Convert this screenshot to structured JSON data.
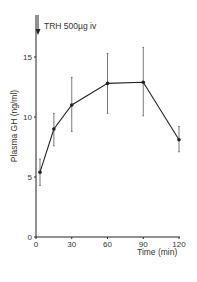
{
  "chart_data": {
    "type": "line",
    "title": "",
    "xlabel": "Time (min)",
    "ylabel": "Plasma GH (ng/ml)",
    "x": [
      0,
      15,
      30,
      60,
      90,
      120
    ],
    "series": [
      {
        "name": "Plasma GH",
        "values": [
          5.4,
          9.0,
          11.0,
          12.8,
          12.9,
          8.1
        ],
        "error_upper": [
          6.5,
          10.3,
          13.3,
          15.3,
          15.8,
          9.2
        ],
        "error_lower": [
          4.3,
          7.6,
          8.8,
          10.3,
          10.1,
          7.1
        ]
      }
    ],
    "xticks": [
      0,
      30,
      60,
      90,
      120
    ],
    "yticks": [
      0,
      5,
      10,
      15
    ],
    "xlim": [
      0,
      120
    ],
    "ylim": [
      0,
      17
    ],
    "grid": false,
    "legend": "none",
    "annotations": [
      {
        "text": "TRH 500µg iv",
        "x": 0,
        "type": "arrow-down"
      }
    ]
  },
  "labels": {
    "annotation": "TRH 500µg iv",
    "xlabel": "Time (min)",
    "ylabel": "Plasma GH (ng/ml)"
  },
  "colors": {
    "ink": "#222222",
    "background": "#ffffff"
  }
}
